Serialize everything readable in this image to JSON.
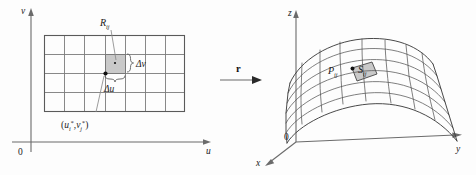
{
  "figure": {
    "background_color": "#fdfdfd",
    "shaded_fill": "#c9c9c9",
    "line_color": "#555555"
  },
  "left_panel": {
    "name": "uv-parameter-domain",
    "axis_v_label": "v",
    "axis_u_label": "u",
    "origin_label": "0",
    "grid": {
      "columns": 7,
      "rows": 4
    },
    "region_label": "R",
    "region_sub": "ij",
    "delta_v_label": "Δv",
    "delta_u_label": "Δu",
    "point_label_open": "(",
    "point_u": "u",
    "point_u_sub": "i",
    "point_u_sup": "*",
    "point_comma": ",",
    "point_v": "v",
    "point_v_sub": "j",
    "point_v_sup": "*",
    "point_label_close": ")"
  },
  "map_arrow": {
    "name": "mapping-arrow",
    "label": "r"
  },
  "right_panel": {
    "name": "xyz-surface-space",
    "axis_z_label": "z",
    "axis_y_label": "y",
    "axis_x_label": "x",
    "origin_label": "0",
    "point_label": "P",
    "point_sub": "ij",
    "patch_label": "S",
    "patch_sub": "ij",
    "surface": {
      "u_divisions": 8,
      "v_divisions": 6
    }
  }
}
